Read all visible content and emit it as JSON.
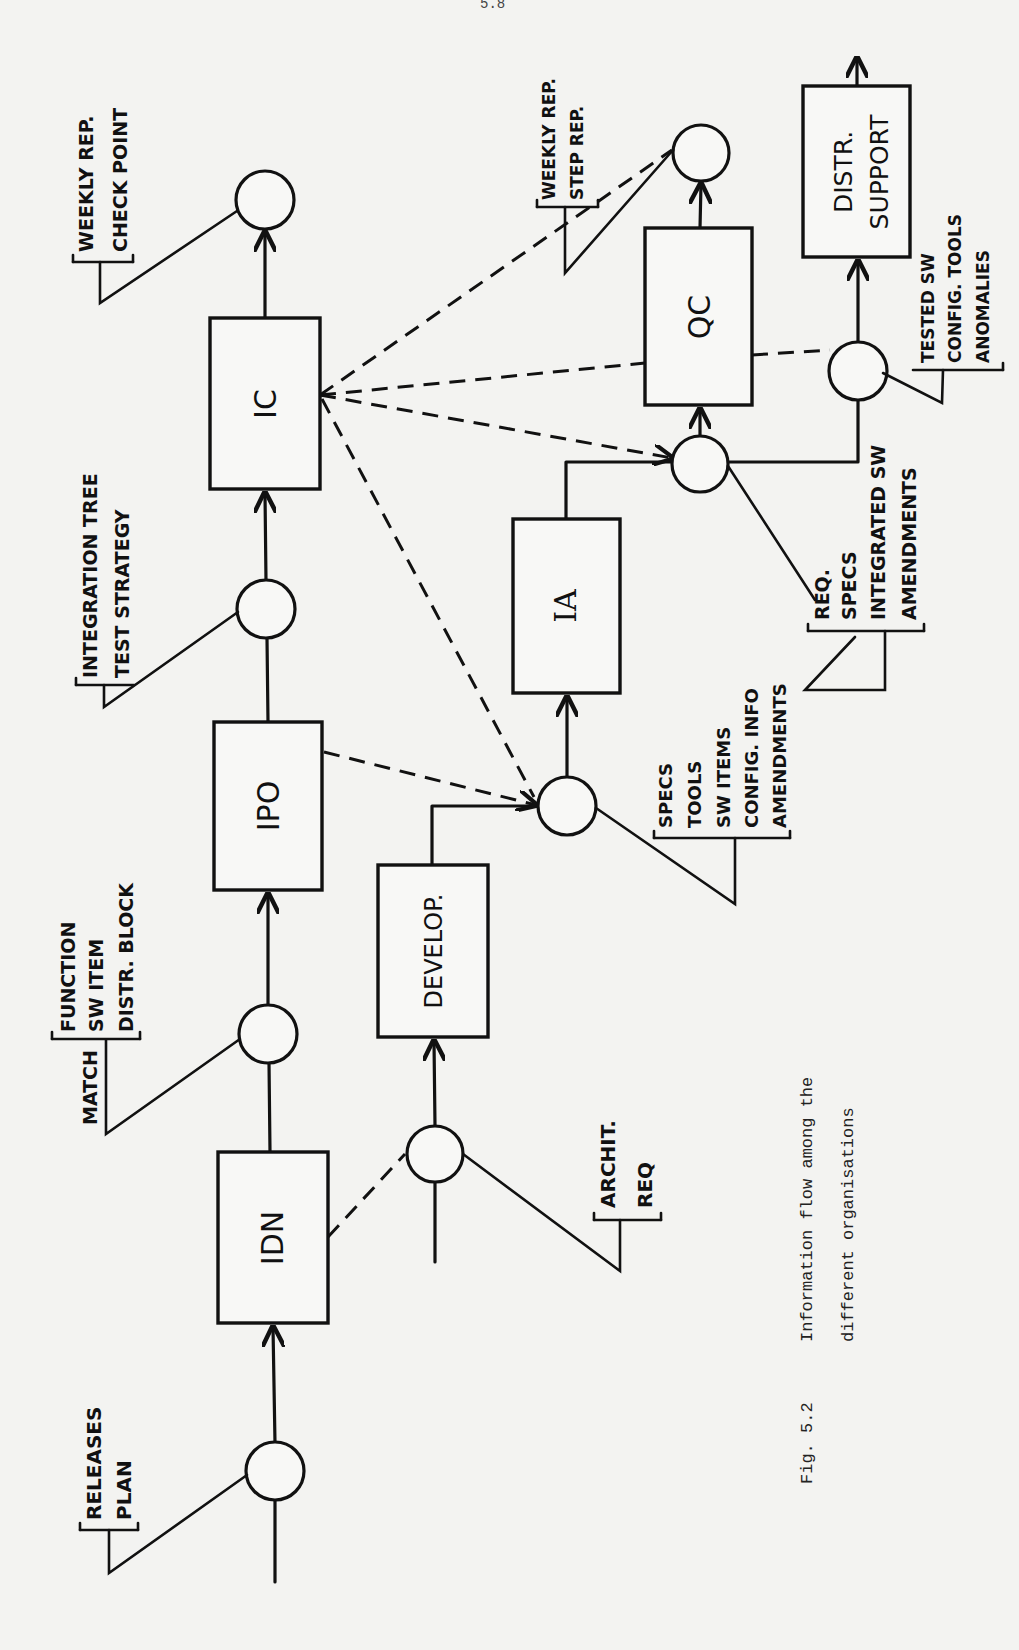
{
  "page": {
    "number": "5.8"
  },
  "figure": {
    "label": "Fig. 5.2",
    "caption_line1": "Information flow among the",
    "caption_line2": "different organisations"
  },
  "boxes": {
    "ic": "IC",
    "ipo": "IPO",
    "idn": "IDN",
    "develop": "DEVELOP.",
    "ia": "IA",
    "qc": "QC",
    "distr_line1": "DISTR.",
    "distr_line2": "SUPPORT"
  },
  "annotations": {
    "weekly_checkpoint": [
      "WEEKLY REP.",
      "CHECK POINT"
    ],
    "integration_tree": [
      "INTEGRATION TREE",
      "TEST STRATEGY"
    ],
    "match": {
      "side": "MATCH",
      "lines": [
        "FUNCTION",
        "SW ITEM",
        "DISTR. BLOCK"
      ]
    },
    "releases_plan": [
      "RELEASES",
      "PLAN"
    ],
    "archit_req": [
      "ARCHIT.",
      "REQ"
    ],
    "specs_tools": [
      "SPECS",
      "TOOLS",
      "SW ITEMS",
      "CONFIG. INFO",
      "AMENDMENTS"
    ],
    "req_specs": [
      "REQ.",
      "SPECS",
      "INTEGRATED SW",
      "AMENDMENTS"
    ],
    "weekly_step": [
      "WEEKLY REP.",
      "STEP REP."
    ],
    "tested_sw": [
      "TESTED SW",
      "CONFIG. TOOLS",
      "ANOMALIES"
    ]
  },
  "colors": {
    "ink": "#111111",
    "paper": "#f3f3f1"
  }
}
